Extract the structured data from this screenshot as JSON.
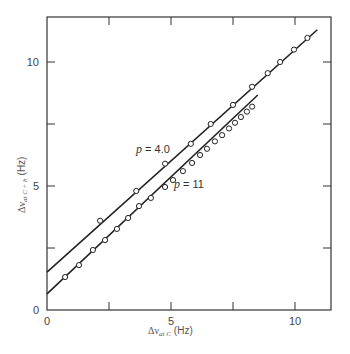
{
  "chart_data": {
    "type": "scatter",
    "title": "",
    "xlabel": "Δν at C (Hz)",
    "ylabel": "Δν at C + h (Hz)",
    "xlabel_parts": {
      "symbol": "Δν",
      "sub": "at C",
      "unit": "(Hz)"
    },
    "ylabel_parts": {
      "symbol": "Δν",
      "sub": "at C + h",
      "unit": "(Hz)"
    },
    "xlim": [
      0,
      11.4
    ],
    "ylim": [
      0,
      11.8
    ],
    "x_ticks": [
      0,
      2.5,
      5,
      7.5,
      10
    ],
    "x_tick_labels": [
      "0",
      "",
      "5",
      "",
      "10"
    ],
    "y_ticks": [
      0,
      2.5,
      5,
      7.5,
      10
    ],
    "y_tick_labels": [
      "0",
      "",
      "5",
      "",
      "10"
    ],
    "grid": false,
    "legend": "inline labels",
    "series": [
      {
        "name": "p = 4.0",
        "label_symbol": "p",
        "label_value": "= 4.0",
        "marker": "open-circle",
        "fit_line": {
          "x_start": 0,
          "y_start": 1.53,
          "x_end": 10.9,
          "y_end": 11.3
        },
        "points": [
          [
            2.14,
            3.6
          ],
          [
            3.6,
            4.8
          ],
          [
            4.76,
            5.9
          ],
          [
            5.8,
            6.7
          ],
          [
            6.6,
            7.5
          ],
          [
            7.5,
            8.27
          ],
          [
            8.27,
            9.0
          ],
          [
            8.9,
            9.55
          ],
          [
            9.4,
            10.0
          ],
          [
            9.96,
            10.5
          ],
          [
            10.5,
            10.97
          ]
        ]
      },
      {
        "name": "p = 11",
        "label_symbol": "p",
        "label_value": "= 11",
        "marker": "open-circle",
        "fit_line": {
          "x_start": 0,
          "y_start": 0.65,
          "x_end": 8.5,
          "y_end": 8.67
        },
        "points": [
          [
            0.73,
            1.33
          ],
          [
            1.29,
            1.81
          ],
          [
            1.85,
            2.42
          ],
          [
            2.34,
            2.82
          ],
          [
            2.82,
            3.27
          ],
          [
            3.27,
            3.71
          ],
          [
            3.71,
            4.19
          ],
          [
            4.19,
            4.52
          ],
          [
            4.76,
            4.96
          ],
          [
            5.08,
            5.24
          ],
          [
            5.48,
            5.6
          ],
          [
            5.85,
            5.93
          ],
          [
            6.17,
            6.25
          ],
          [
            6.45,
            6.5
          ],
          [
            6.77,
            6.8
          ],
          [
            7.06,
            7.05
          ],
          [
            7.34,
            7.32
          ],
          [
            7.58,
            7.55
          ],
          [
            7.82,
            7.78
          ],
          [
            8.06,
            8.0
          ],
          [
            8.27,
            8.2
          ]
        ]
      }
    ]
  }
}
